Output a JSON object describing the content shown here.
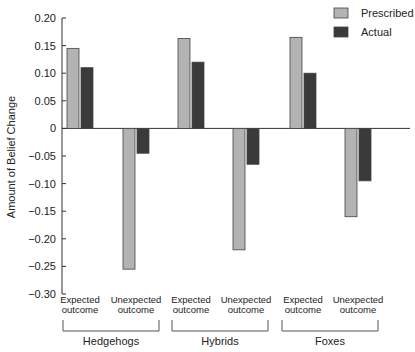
{
  "chart_data": {
    "type": "bar",
    "title": "",
    "xlabel": "",
    "ylabel": "Amount of Belief Change",
    "ylim": [
      -0.3,
      0.2
    ],
    "yticks": [
      0.2,
      0.15,
      0.1,
      0.05,
      0,
      -0.05,
      -0.1,
      -0.15,
      -0.2,
      -0.25,
      -0.3
    ],
    "ytick_labels": [
      "0.20",
      "0.15",
      "0.10",
      "0.05",
      "0",
      "−0.05",
      "−0.10",
      "−0.15",
      "−0.20",
      "−0.25",
      "−0.30"
    ],
    "grid": false,
    "legend_position": "top-right",
    "groups": [
      "Hedgehogs",
      "Hybrids",
      "Foxes"
    ],
    "categories": [
      {
        "group": "Hedgehogs",
        "line1": "Expected",
        "line2": "outcome"
      },
      {
        "group": "Hedgehogs",
        "line1": "Unexpected",
        "line2": "outcome"
      },
      {
        "group": "Hybrids",
        "line1": "Expected",
        "line2": "outcome"
      },
      {
        "group": "Hybrids",
        "line1": "Unexpected",
        "line2": "outcome"
      },
      {
        "group": "Foxes",
        "line1": "Expected",
        "line2": "outcome"
      },
      {
        "group": "Foxes",
        "line1": "Unexpected",
        "line2": "outcome"
      }
    ],
    "series": [
      {
        "name": "Prescribed",
        "color": "#b3b3b3",
        "values": [
          0.145,
          -0.255,
          0.163,
          -0.22,
          0.165,
          -0.16
        ]
      },
      {
        "name": "Actual",
        "color": "#3a3a3a",
        "values": [
          0.11,
          -0.045,
          0.12,
          -0.065,
          0.1,
          -0.095
        ]
      }
    ]
  }
}
